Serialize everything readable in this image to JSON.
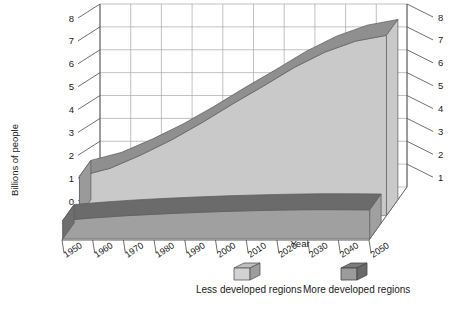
{
  "chart_data": {
    "type": "area",
    "title": "",
    "xlabel": "Year",
    "ylabel": "Billions of people",
    "x": [
      1950,
      1960,
      1970,
      1980,
      1990,
      2000,
      2010,
      2020,
      2030,
      2040,
      2050
    ],
    "categories": [
      "1950",
      "1960",
      "1970",
      "1980",
      "1990",
      "2000",
      "2010",
      "2020",
      "2030",
      "2040",
      "2050"
    ],
    "ylim": [
      0,
      8
    ],
    "y_left_ticks": [
      "0",
      "1",
      "2",
      "3",
      "4",
      "5",
      "6",
      "7",
      "8"
    ],
    "y_right_ticks": [
      "1",
      "2",
      "3",
      "4",
      "5",
      "6",
      "7",
      "8"
    ],
    "grid": true,
    "legend_position": "bottom",
    "projection": "3d-ribbon",
    "series": [
      {
        "name": "Less developed regions",
        "color": "#c9c9c9",
        "top_color": "#8f8f8f",
        "side_color": "#9a9a9a",
        "values": [
          1.72,
          2.07,
          2.65,
          3.31,
          4.07,
          4.89,
          5.67,
          6.48,
          7.15,
          7.63,
          7.88
        ]
      },
      {
        "name": "More developed regions",
        "color": "#a0a0a0",
        "top_color": "#6b6b6b",
        "side_color": "#6f6f6f",
        "values": [
          0.81,
          0.92,
          1.01,
          1.08,
          1.14,
          1.19,
          1.23,
          1.26,
          1.28,
          1.28,
          1.27
        ]
      }
    ]
  },
  "axes": {
    "y_label": "Billions of people",
    "x_label": "Year"
  },
  "legend": {
    "items": [
      {
        "label": "Less developed regions",
        "swatch": "light-box-icon"
      },
      {
        "label": "More developed regions",
        "swatch": "dark-box-icon"
      }
    ]
  },
  "ticks": {
    "left": [
      "8",
      "7",
      "6",
      "5",
      "4",
      "3",
      "2",
      "1",
      "0"
    ],
    "right": [
      "8",
      "7",
      "6",
      "5",
      "4",
      "3",
      "2",
      "1"
    ],
    "years": [
      "1950",
      "1960",
      "1970",
      "1980",
      "1990",
      "2000",
      "2010",
      "2020",
      "2030",
      "2040",
      "2050"
    ]
  },
  "colors": {
    "less_face": "#c9c9c9",
    "less_top": "#8f8f8f",
    "more_face": "#a0a0a0",
    "more_top": "#6b6b6b",
    "grid": "#a8a8a8",
    "axis": "#4a4a4a",
    "text": "#1a1a1a"
  }
}
